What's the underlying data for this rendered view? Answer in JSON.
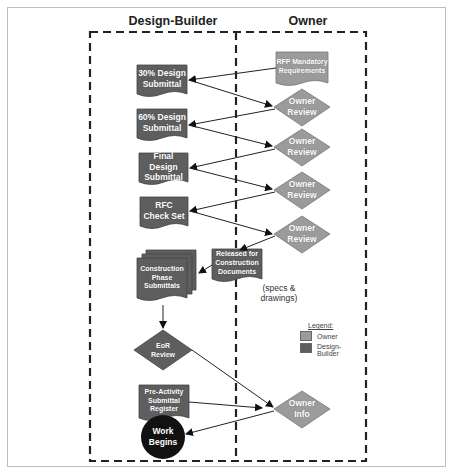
{
  "lanes": {
    "left": "Design-Builder",
    "right": "Owner"
  },
  "nodes": {
    "rfp": "RFP Mandatory Requirements",
    "d30": "30% Design Submittal",
    "d60": "60% Design Submittal",
    "dfinal": "Final Design Submittal",
    "rfc": "RFC Check Set",
    "review1": "Owner Review",
    "review2": "Owner Review",
    "review3": "Owner Review",
    "review4": "Owner Review",
    "released": "Released for Construction Documents",
    "released_note": "(specs & drawings)",
    "cps": "Construction Phase Submittals",
    "eor": "EoR Review",
    "pre": "Pre-Activity Submittal Register",
    "ownerinfo": "Owner Info",
    "work": "Work Begins"
  },
  "legend": {
    "title": "Legend:",
    "items": [
      {
        "label": "Owner",
        "color": "#9b9b9b"
      },
      {
        "label": "Design-Builder",
        "color": "#5e5e5e"
      }
    ]
  },
  "colors": {
    "owner": "#9b9b9b",
    "design_builder": "#5e5e5e",
    "terminal": "#111111"
  }
}
